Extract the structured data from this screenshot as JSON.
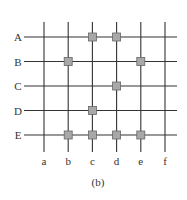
{
  "diagram": {
    "caption": "(b)",
    "rows": [
      "A",
      "B",
      "C",
      "D",
      "E"
    ],
    "columns": [
      "a",
      "b",
      "c",
      "d",
      "e",
      "f"
    ],
    "nodes": [
      {
        "row": "A",
        "col": "c"
      },
      {
        "row": "A",
        "col": "d"
      },
      {
        "row": "B",
        "col": "b"
      },
      {
        "row": "B",
        "col": "e"
      },
      {
        "row": "C",
        "col": "d"
      },
      {
        "row": "D",
        "col": "c"
      },
      {
        "row": "E",
        "col": "b"
      },
      {
        "row": "E",
        "col": "c"
      },
      {
        "row": "E",
        "col": "d"
      },
      {
        "row": "E",
        "col": "e"
      }
    ],
    "colors": {
      "line": "#333333",
      "node_fill": "#a8a8a8",
      "node_stroke": "#666666"
    }
  }
}
